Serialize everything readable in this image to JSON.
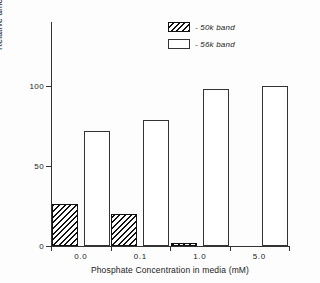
{
  "chart_data": {
    "type": "bar",
    "title": "",
    "xlabel": "Phosphate Concentration in media (mM)",
    "ylabel": "Relative amounts as % of total nucleocapsid antigen",
    "categories": [
      "0.0",
      "0.1",
      "1.0",
      "5.0"
    ],
    "series": [
      {
        "name": "- 50k band",
        "style": "hatched",
        "values": [
          26,
          20,
          2,
          0
        ]
      },
      {
        "name": "- 56k band",
        "style": "open",
        "values": [
          72,
          79,
          98,
          100
        ]
      }
    ],
    "ylim": [
      0,
      140
    ],
    "y_ticks": [
      0,
      50,
      100
    ],
    "y_tick_labels": [
      "0",
      "50",
      "100"
    ],
    "grid": false,
    "legend_position": "top-right",
    "colors": {
      "axis": "#333333",
      "hatch_line": "#111111",
      "bar_fill": "#ffffff",
      "text": "#1a1a1a",
      "background": "#fdfdfd"
    }
  },
  "legend": {
    "items": [
      {
        "label": "- 50k band",
        "swatch": "hatched-swatch"
      },
      {
        "label": "- 56k band",
        "swatch": "open-swatch"
      }
    ]
  }
}
